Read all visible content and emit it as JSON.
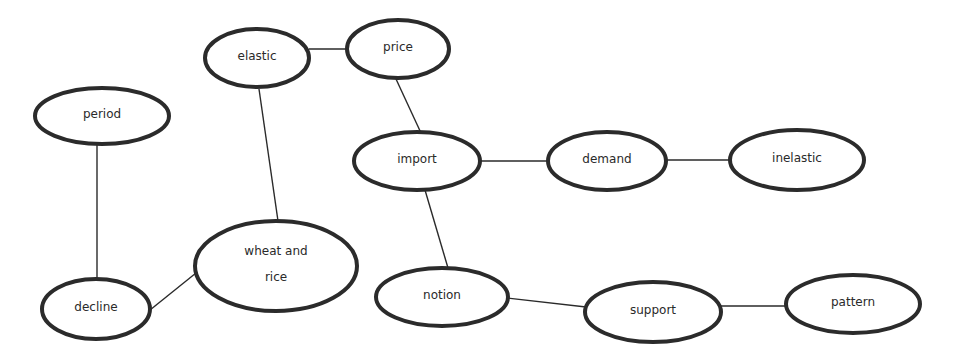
{
  "diagram": {
    "type": "concept-map",
    "nodes": [
      {
        "id": "elastic",
        "label": "elastic",
        "lines": [
          "elastic"
        ],
        "cx": 257,
        "cy": 58,
        "rx": 52,
        "ry": 29
      },
      {
        "id": "price",
        "label": "price",
        "lines": [
          "price"
        ],
        "cx": 398,
        "cy": 49,
        "rx": 51,
        "ry": 29
      },
      {
        "id": "period",
        "label": "period",
        "lines": [
          "period"
        ],
        "cx": 102,
        "cy": 116,
        "rx": 67,
        "ry": 28
      },
      {
        "id": "import",
        "label": "import",
        "lines": [
          "import"
        ],
        "cx": 417,
        "cy": 161,
        "rx": 63,
        "ry": 29
      },
      {
        "id": "demand",
        "label": "demand",
        "lines": [
          "demand"
        ],
        "cx": 607,
        "cy": 161,
        "rx": 59,
        "ry": 29
      },
      {
        "id": "inelastic",
        "label": "inelastic",
        "lines": [
          "inelastic"
        ],
        "cx": 797,
        "cy": 160,
        "rx": 67,
        "ry": 30
      },
      {
        "id": "wheat_and_rice",
        "label": "wheat and rice",
        "lines": [
          "wheat and",
          "rice"
        ],
        "cx": 276,
        "cy": 266,
        "rx": 81,
        "ry": 45
      },
      {
        "id": "decline",
        "label": "decline",
        "lines": [
          "decline"
        ],
        "cx": 96,
        "cy": 309,
        "rx": 54,
        "ry": 30
      },
      {
        "id": "notion",
        "label": "notion",
        "lines": [
          "notion"
        ],
        "cx": 442,
        "cy": 297,
        "rx": 66,
        "ry": 29
      },
      {
        "id": "support",
        "label": "support",
        "lines": [
          "support"
        ],
        "cx": 653,
        "cy": 312,
        "rx": 68,
        "ry": 30
      },
      {
        "id": "pattern",
        "label": "pattern",
        "lines": [
          "pattern"
        ],
        "cx": 853,
        "cy": 304,
        "rx": 67,
        "ry": 29
      }
    ],
    "edges": [
      {
        "from": "elastic",
        "to": "price",
        "x1": 309,
        "y1": 49,
        "x2": 347,
        "y2": 49
      },
      {
        "from": "price",
        "to": "import",
        "x1": 396,
        "y1": 79,
        "x2": 421,
        "y2": 133
      },
      {
        "from": "elastic",
        "to": "wheat_and_rice",
        "x1": 259,
        "y1": 89,
        "x2": 278,
        "y2": 221
      },
      {
        "from": "period",
        "to": "decline",
        "x1": 97,
        "y1": 145,
        "x2": 97,
        "y2": 280
      },
      {
        "from": "decline",
        "to": "wheat_and_rice",
        "x1": 150,
        "y1": 310,
        "x2": 196,
        "y2": 273
      },
      {
        "from": "import",
        "to": "demand",
        "x1": 480,
        "y1": 161,
        "x2": 548,
        "y2": 161
      },
      {
        "from": "demand",
        "to": "inelastic",
        "x1": 666,
        "y1": 160,
        "x2": 730,
        "y2": 160
      },
      {
        "from": "import",
        "to": "notion",
        "x1": 425,
        "y1": 190,
        "x2": 448,
        "y2": 268
      },
      {
        "from": "notion",
        "to": "support",
        "x1": 507,
        "y1": 298,
        "x2": 586,
        "y2": 307
      },
      {
        "from": "support",
        "to": "pattern",
        "x1": 721,
        "y1": 306,
        "x2": 786,
        "y2": 306
      }
    ],
    "colors": {
      "background": "#ffffff",
      "stroke": "#2b2b2b",
      "text": "#2a2a2a"
    }
  }
}
